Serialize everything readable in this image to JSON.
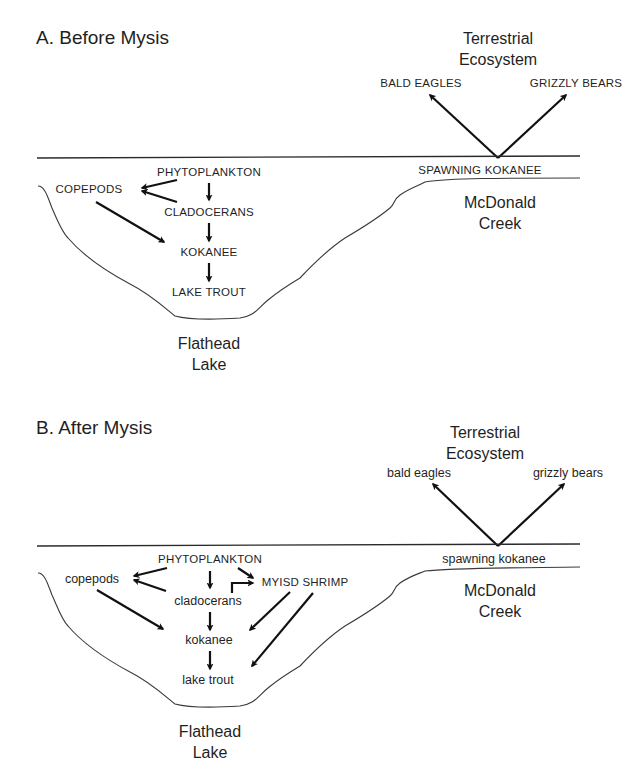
{
  "panels": [
    {
      "title": "A. Before Mysis",
      "terrestrial_label_line1": "Terrestrial",
      "terrestrial_label_line2": "Ecosystem",
      "predators": {
        "left": "BALD EAGLES",
        "right": "GRIZZLY BEARS"
      },
      "spawning": "SPAWNING KOKANEE",
      "creek_line1": "McDonald",
      "creek_line2": "Creek",
      "lake_line1": "Flathead",
      "lake_line2": "Lake",
      "nodes": {
        "phytoplankton": "PHYTOPLANKTON",
        "copepods": "COPEPODS",
        "cladocerans": "CLADOCERANS",
        "kokanee": "KOKANEE",
        "lake_trout": "LAKE TROUT"
      }
    },
    {
      "title": "B. After Mysis",
      "terrestrial_label_line1": "Terrestrial",
      "terrestrial_label_line2": "Ecosystem",
      "predators": {
        "left": "bald eagles",
        "right": "grizzly bears"
      },
      "spawning": "spawning kokanee",
      "creek_line1": "McDonald",
      "creek_line2": "Creek",
      "lake_line1": "Flathead",
      "lake_line2": "Lake",
      "nodes": {
        "phytoplankton": "PHYTOPLANKTON",
        "copepods": "copepods",
        "cladocerans": "cladocerans",
        "shrimp": "MYISD SHRIMP",
        "kokanee": "kokanee",
        "lake_trout": "lake trout"
      }
    }
  ],
  "food_web_edges": {
    "before": [
      [
        "phytoplankton",
        "copepods"
      ],
      [
        "phytoplankton",
        "cladocerans"
      ],
      [
        "cladocerans",
        "copepods"
      ],
      [
        "copepods",
        "kokanee"
      ],
      [
        "cladocerans",
        "kokanee"
      ],
      [
        "kokanee",
        "lake_trout"
      ],
      [
        "spawning_kokanee",
        "bald_eagles"
      ],
      [
        "spawning_kokanee",
        "grizzly_bears"
      ]
    ],
    "after": [
      [
        "phytoplankton",
        "copepods"
      ],
      [
        "phytoplankton",
        "cladocerans"
      ],
      [
        "phytoplankton",
        "shrimp"
      ],
      [
        "cladocerans",
        "copepods"
      ],
      [
        "cladocerans",
        "shrimp"
      ],
      [
        "copepods",
        "kokanee"
      ],
      [
        "cladocerans",
        "kokanee"
      ],
      [
        "shrimp",
        "kokanee"
      ],
      [
        "shrimp",
        "lake_trout"
      ],
      [
        "kokanee",
        "lake_trout"
      ],
      [
        "spawning_kokanee",
        "bald_eagles"
      ],
      [
        "spawning_kokanee",
        "grizzly_bears"
      ]
    ]
  }
}
